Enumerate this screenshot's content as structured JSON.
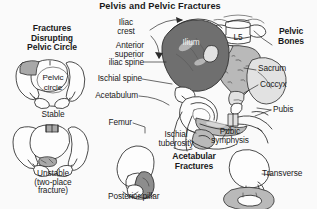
{
  "figure": {
    "title": "Pelvis and Pelvic Fractures",
    "background_color": "#fafafa",
    "ink_color": "#2b2b2b"
  },
  "panels": {
    "left": {
      "heading": "Fractures\nDisrupting\nPelvic Circle",
      "stable": {
        "inner_label": "Pelvic\ncircle",
        "caption": "Stable"
      },
      "unstable": {
        "caption": "Unstable\n(two-place\nfracture)"
      }
    },
    "center": {
      "heading": "Pelvic\nBones",
      "labels": [
        {
          "name": "iliac-crest",
          "text": "Iliac\ncrest"
        },
        {
          "name": "anterior-superior-iliac-spine",
          "text": "Anterior\nsuperior\niliac spine"
        },
        {
          "name": "ischial-spine",
          "text": "Ischial spine"
        },
        {
          "name": "acetabulum",
          "text": "Acetabulum"
        },
        {
          "name": "femur",
          "text": "Femur"
        },
        {
          "name": "ilium",
          "text": "Ilium"
        },
        {
          "name": "l5-vertebra",
          "text": "L5"
        },
        {
          "name": "sacrum",
          "text": "Sacrum"
        },
        {
          "name": "coccyx",
          "text": "Coccyx"
        },
        {
          "name": "pubis",
          "text": "Pubis"
        },
        {
          "name": "pubic-symphysis",
          "text": "Pubic\nsymphysis"
        },
        {
          "name": "ischial-tuberosity",
          "text": "Ischial\ntuberosity"
        }
      ]
    },
    "bottom": {
      "heading": "Acetabular\nFractures",
      "posterior_pillar": {
        "caption": "Posterior pillar"
      },
      "transverse": {
        "caption": "Transverse"
      }
    }
  }
}
